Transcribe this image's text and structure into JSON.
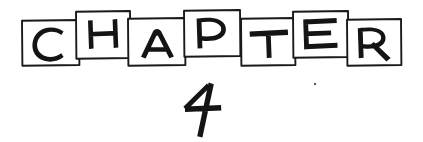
{
  "page": {
    "kind": "scanned-chapter-heading",
    "width": 423,
    "height": 142,
    "background_color": "#ffffff",
    "ink_color": "#1a1a1a"
  },
  "heading": {
    "word": "CHAPTER",
    "number": "4",
    "full_text": "CHAPTER 4",
    "style": "hand-drawn letters in hand-drawn boxes, alternating baseline"
  },
  "letter_tiles": [
    {
      "letter": "C",
      "box": {
        "x": 22,
        "y": 20,
        "w": 57,
        "h": 45
      },
      "raised": false,
      "letter_center_x": 50,
      "letter_baseline_y": 55
    },
    {
      "letter": "H",
      "box": {
        "x": 76,
        "y": 11,
        "w": 54,
        "h": 47
      },
      "raised": true,
      "letter_center_x": 103,
      "letter_baseline_y": 47
    },
    {
      "letter": "A",
      "box": {
        "x": 128,
        "y": 18,
        "w": 57,
        "h": 47
      },
      "raised": false,
      "letter_center_x": 157,
      "letter_baseline_y": 56
    },
    {
      "letter": "P",
      "box": {
        "x": 184,
        "y": 10,
        "w": 56,
        "h": 46
      },
      "raised": true,
      "letter_center_x": 211,
      "letter_baseline_y": 46
    },
    {
      "letter": "T",
      "box": {
        "x": 241,
        "y": 18,
        "w": 54,
        "h": 47
      },
      "raised": false,
      "letter_center_x": 268,
      "letter_baseline_y": 56
    },
    {
      "letter": "E",
      "box": {
        "x": 293,
        "y": 11,
        "w": 55,
        "h": 46
      },
      "raised": true,
      "letter_center_x": 320,
      "letter_baseline_y": 47
    },
    {
      "letter": "R",
      "box": {
        "x": 347,
        "y": 19,
        "w": 54,
        "h": 46
      },
      "raised": false,
      "letter_center_x": 374,
      "letter_baseline_y": 57
    }
  ],
  "number_glyph": {
    "value": "4",
    "x": 184,
    "y": 82,
    "w": 40,
    "h": 56,
    "description": "hand-drawn open-top numeral four with slanted diagonal and long descending stem"
  },
  "marks": [
    {
      "name": "stray-speck",
      "x": 315,
      "y": 84,
      "r": 1.2
    }
  ]
}
